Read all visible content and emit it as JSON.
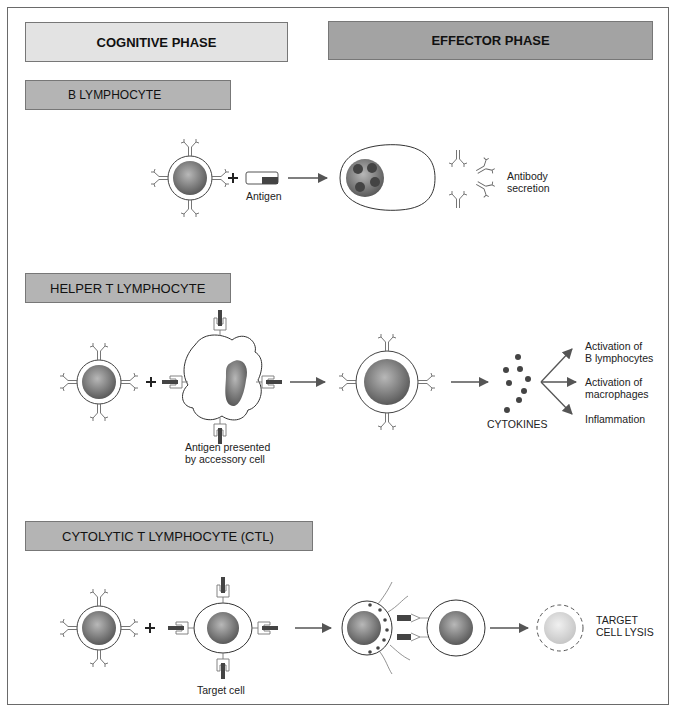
{
  "phases": {
    "cognitive": "COGNITIVE PHASE",
    "effector": "EFFECTOR PHASE"
  },
  "sections": [
    {
      "title": "B LYMPHOCYTE",
      "labels": {
        "antigen": "Antigen",
        "antibody_line1": "Antibody",
        "antibody_line2": "secretion"
      }
    },
    {
      "title": "HELPER T LYMPHOCYTE",
      "labels": {
        "apc_line1": "Antigen presented",
        "apc_line2": "by accessory cell",
        "cytokines": "CYTOKINES",
        "outcome1_line1": "Activation of",
        "outcome1_line2": "B lymphocytes",
        "outcome2_line1": "Activation of",
        "outcome2_line2": "macrophages",
        "outcome3": "Inflammation"
      }
    },
    {
      "title": "CYTOLYTIC T LYMPHOCYTE (CTL)",
      "labels": {
        "target_cell": "Target cell",
        "lysis_line1": "TARGET",
        "lysis_line2": "CELL LYSIS"
      }
    }
  ],
  "colors": {
    "cognitive_box": "#e3e3e3",
    "effector_box": "#a3a3a3",
    "section_box": "#b4b4b4",
    "nucleus": "#7a7a7a",
    "arrow": "#555555"
  }
}
